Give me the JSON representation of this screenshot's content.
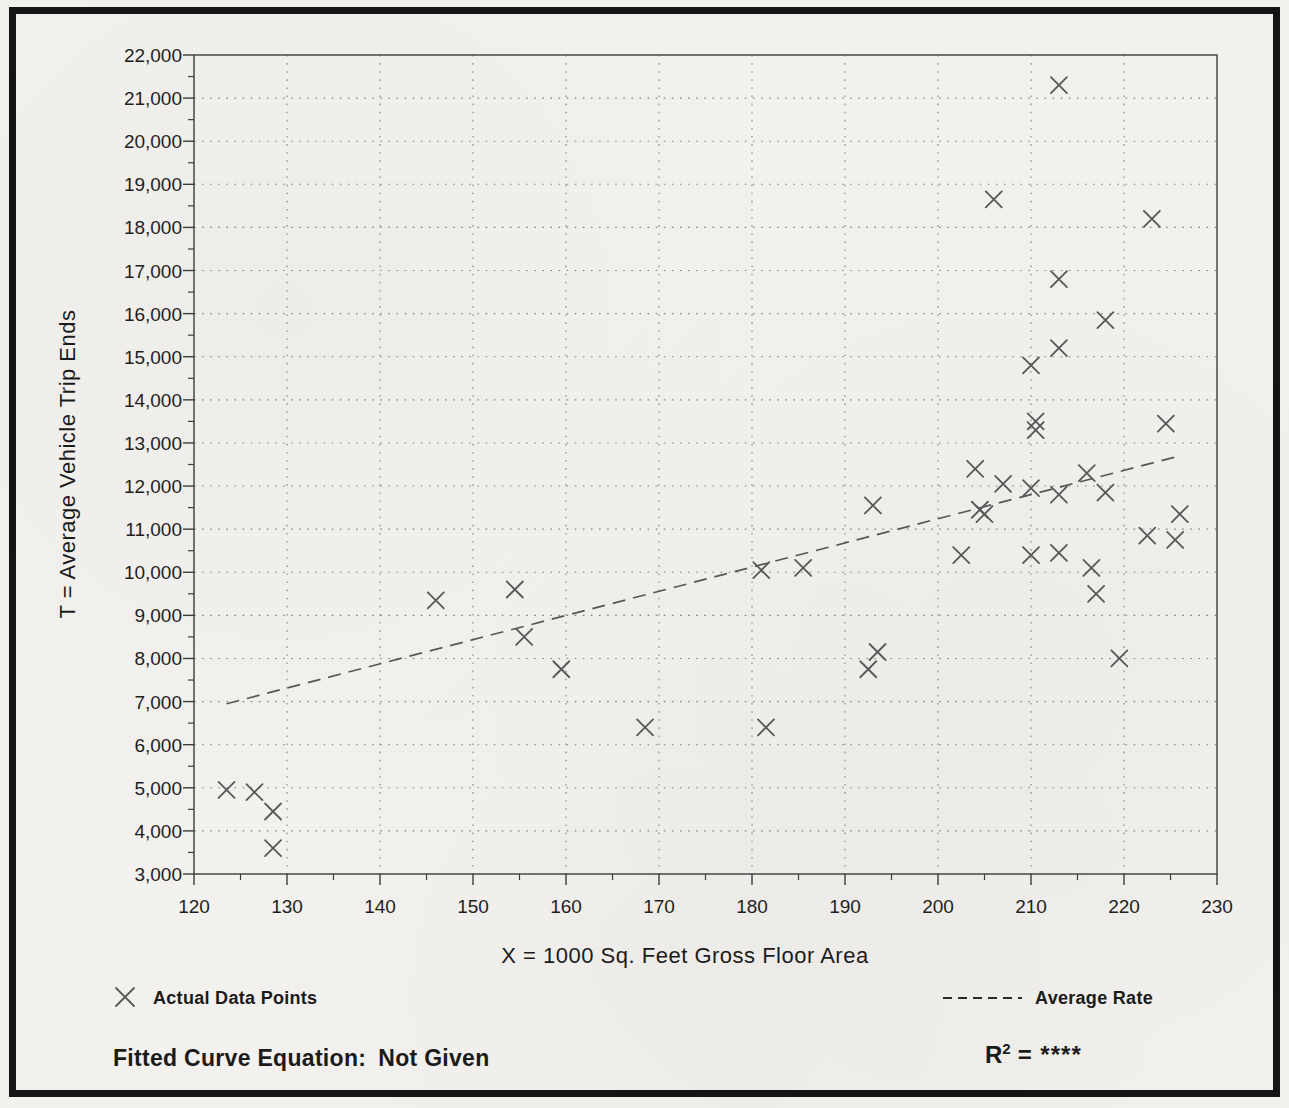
{
  "chart_data": {
    "type": "scatter",
    "title": "",
    "xlabel": "X = 1000 Sq. Feet Gross Floor Area",
    "ylabel": "T = Average Vehicle Trip Ends",
    "xlim": [
      120,
      230
    ],
    "ylim": [
      3000,
      22000
    ],
    "x_tick_step": 10,
    "x_minor_tick_step": 5,
    "y_tick_step": 1000,
    "y_minor_tick_step": 500,
    "grid": "dotted-both-axes",
    "marker": "x-cross",
    "points": [
      [
        123.5,
        4950
      ],
      [
        126.5,
        4900
      ],
      [
        128.5,
        4450
      ],
      [
        128.5,
        3600
      ],
      [
        146,
        9350
      ],
      [
        154.5,
        9600
      ],
      [
        155.5,
        8500
      ],
      [
        159.5,
        7750
      ],
      [
        168.5,
        6400
      ],
      [
        181.5,
        6400
      ],
      [
        181,
        10050
      ],
      [
        185.5,
        10100
      ],
      [
        192.5,
        7750
      ],
      [
        193.5,
        8150
      ],
      [
        193,
        11550
      ],
      [
        202.5,
        10400
      ],
      [
        204,
        12400
      ],
      [
        204.5,
        11450
      ],
      [
        205,
        11350
      ],
      [
        206,
        18650
      ],
      [
        207,
        12050
      ],
      [
        210,
        14800
      ],
      [
        210,
        11950
      ],
      [
        210,
        10400
      ],
      [
        210.5,
        13500
      ],
      [
        210.5,
        13300
      ],
      [
        213,
        21300
      ],
      [
        213,
        16800
      ],
      [
        213,
        15200
      ],
      [
        213,
        11800
      ],
      [
        213,
        10450
      ],
      [
        216,
        12300
      ],
      [
        216.5,
        10100
      ],
      [
        217,
        9500
      ],
      [
        218,
        15850
      ],
      [
        218,
        11850
      ],
      [
        219.5,
        8000
      ],
      [
        222.5,
        10850
      ],
      [
        223,
        18200
      ],
      [
        224.5,
        13450
      ],
      [
        225.5,
        10750
      ],
      [
        226,
        11350
      ]
    ],
    "trend_line": {
      "label": "Average Rate",
      "style": "dashed",
      "x1": 123.5,
      "y1": 6950,
      "x2": 226,
      "y2": 12700
    },
    "legend_position": "bottom"
  },
  "legend": {
    "actual_label": "Actual Data Points",
    "actual_marker": "x-cross",
    "average_label": "Average Rate",
    "average_marker": "dashed-line"
  },
  "footer": {
    "fitted_label": "Fitted Curve Equation:",
    "fitted_value": "Not Given",
    "r_label": "R",
    "r_exponent": "2",
    "r_value": "= ****"
  },
  "colors": {
    "paper": "#f3f1ee",
    "frame": "#151515",
    "axis": "#3c3c3c",
    "grid": "#707070",
    "marker": "#575757",
    "text": "#1b1b1b"
  }
}
